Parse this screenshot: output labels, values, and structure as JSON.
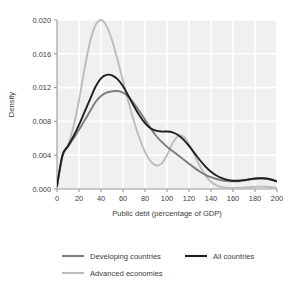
{
  "chart_data": {
    "type": "line",
    "title": "Density of Public Debt, 1990–2005",
    "xlabel": "Public debt (percentage of GDP)",
    "ylabel": "Density",
    "xlim": [
      0,
      200
    ],
    "ylim": [
      0.0,
      0.02
    ],
    "xticks": [
      0,
      20,
      40,
      60,
      80,
      100,
      120,
      140,
      160,
      180,
      200
    ],
    "yticks": [
      0.0,
      0.004,
      0.008,
      0.012,
      0.016,
      0.02
    ],
    "xtick_labels": [
      "0",
      "20",
      "40",
      "60",
      "80",
      "100",
      "120",
      "140",
      "160",
      "180",
      "200"
    ],
    "ytick_labels": [
      "0.000",
      "0.004",
      "0.008",
      "0.012",
      "0.016",
      "0.020"
    ],
    "grid": true,
    "legend_position": "bottom",
    "x": [
      0,
      5,
      10,
      15,
      20,
      25,
      30,
      35,
      40,
      45,
      50,
      55,
      60,
      65,
      70,
      75,
      80,
      85,
      90,
      95,
      100,
      105,
      110,
      115,
      120,
      125,
      130,
      135,
      140,
      145,
      150,
      155,
      160,
      165,
      170,
      175,
      180,
      185,
      190,
      195,
      200
    ],
    "series": [
      {
        "name": "Developing countries",
        "color": "#7d7d7d",
        "values": [
          0.0004,
          0.004,
          0.005,
          0.006,
          0.007,
          0.0081,
          0.0092,
          0.0103,
          0.011,
          0.0114,
          0.01155,
          0.0116,
          0.0114,
          0.0109,
          0.0101,
          0.0092,
          0.0082,
          0.0072,
          0.0063,
          0.0056,
          0.005,
          0.0045,
          0.004,
          0.0035,
          0.003,
          0.0025,
          0.00205,
          0.00168,
          0.0014,
          0.00118,
          0.00102,
          0.00093,
          0.0009,
          0.00092,
          0.001,
          0.00112,
          0.00122,
          0.00127,
          0.00125,
          0.00112,
          0.0009
        ]
      },
      {
        "name": "All countries",
        "color": "#1f1f1f",
        "values": [
          0.00035,
          0.004,
          0.0051,
          0.00625,
          0.0076,
          0.0091,
          0.0106,
          0.0121,
          0.0131,
          0.0135,
          0.01345,
          0.013,
          0.01215,
          0.011,
          0.0098,
          0.0087,
          0.0078,
          0.0072,
          0.0069,
          0.0068,
          0.0068,
          0.0067,
          0.0064,
          0.00585,
          0.0051,
          0.00425,
          0.0034,
          0.00265,
          0.00205,
          0.0016,
          0.00128,
          0.00108,
          0.00098,
          0.00098,
          0.00105,
          0.00115,
          0.00124,
          0.00128,
          0.00124,
          0.0011,
          0.00088
        ]
      },
      {
        "name": "Advanced economies",
        "color": "#bcbcbc",
        "values": [
          0.0002,
          0.0038,
          0.0052,
          0.0074,
          0.0105,
          0.0142,
          0.0174,
          0.0194,
          0.02,
          0.0193,
          0.0176,
          0.0153,
          0.0128,
          0.0103,
          0.008,
          0.006,
          0.0044,
          0.0033,
          0.0028,
          0.003,
          0.004,
          0.0054,
          0.00625,
          0.0062,
          0.0053,
          0.004,
          0.0027,
          0.0016,
          0.00085,
          0.00042,
          0.00022,
          0.00014,
          0.00012,
          0.00014,
          0.00018,
          0.00022,
          0.00026,
          0.00028,
          0.00026,
          0.0002,
          0.00012
        ]
      }
    ]
  },
  "legend": {
    "entries": [
      {
        "label": "Developing countries",
        "color": "#7d7d7d"
      },
      {
        "label": "All countries",
        "color": "#1f1f1f"
      },
      {
        "label": "Advanced economies",
        "color": "#bcbcbc"
      }
    ]
  },
  "plot_style": {
    "plot_background": "#f0f0f0",
    "gridline_color": "#ffffff",
    "axis_color": "#999999",
    "page_background": "#ffffff"
  }
}
